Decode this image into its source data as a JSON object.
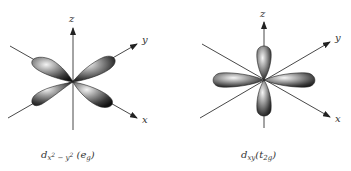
{
  "figures": [
    {
      "id": "dx2-y2",
      "orbital_symbol": "d",
      "subscript_parts": [
        "x",
        "2",
        " − ",
        "y",
        "2"
      ],
      "symmetry_label": "e",
      "symmetry_subscript": "g",
      "axes": {
        "z": "z",
        "y": "y",
        "x": "x"
      },
      "lobe_orientation": "along axes (in xy-plane, 4 lobes)"
    },
    {
      "id": "dxy",
      "orbital_symbol": "d",
      "subscript": "xy",
      "symmetry_label": "t",
      "symmetry_subscript": "2g",
      "axes": {
        "z": "z",
        "y": "y",
        "x": "x"
      },
      "lobe_orientation": "between axes (4 lobes)"
    }
  ],
  "colors": {
    "lobe_dark": "#1a1a1a",
    "lobe_mid": "#6a6a6a",
    "lobe_light": "#e8e8e8",
    "axis": "#333333",
    "background": "#ffffff"
  }
}
